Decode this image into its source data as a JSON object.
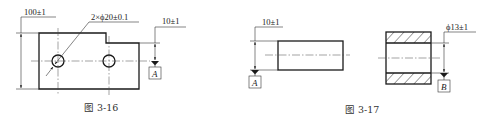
{
  "figures": [
    {
      "id": "fig-3-16",
      "caption": "图 3-16",
      "dimensions": {
        "height": "100±1",
        "holes": "2×ϕ20±0.1",
        "datum_offset": "10±1"
      },
      "datum": "A"
    },
    {
      "id": "fig-3-17",
      "caption": "图 3-17",
      "left_part": {
        "dimension": "10±1",
        "datum": "A"
      },
      "right_part": {
        "dimension": "ϕ13±1",
        "datum": "B"
      }
    }
  ],
  "colors": {
    "line": "#1a1a1a",
    "background": "#ffffff"
  }
}
